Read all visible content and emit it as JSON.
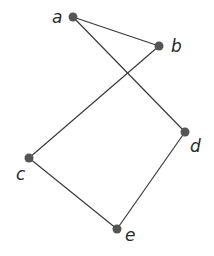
{
  "graph": {
    "nodes": [
      {
        "id": "a",
        "label": "a",
        "x": 73,
        "y": 17,
        "lx": 52,
        "ly": 23
      },
      {
        "id": "b",
        "label": "b",
        "x": 159,
        "y": 46,
        "lx": 171,
        "ly": 52
      },
      {
        "id": "c",
        "label": "c",
        "x": 29,
        "y": 158,
        "lx": 16,
        "ly": 180
      },
      {
        "id": "d",
        "label": "d",
        "x": 185,
        "y": 132,
        "lx": 190,
        "ly": 152
      },
      {
        "id": "e",
        "label": "e",
        "x": 117,
        "y": 229,
        "lx": 125,
        "ly": 241
      }
    ],
    "edges": [
      [
        "a",
        "b"
      ],
      [
        "a",
        "d"
      ],
      [
        "b",
        "c"
      ],
      [
        "c",
        "e"
      ],
      [
        "d",
        "e"
      ]
    ],
    "colors": {
      "node": "#555555",
      "edge": "#3a3a3a",
      "label": "#2a2a2a"
    }
  }
}
